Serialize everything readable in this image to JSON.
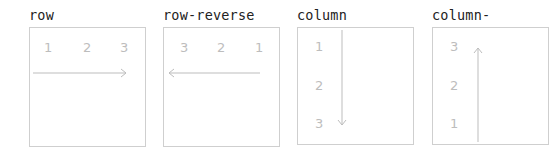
{
  "diagrams": [
    {
      "label": "row",
      "items": [
        "1",
        "2",
        "3"
      ],
      "direction": "right"
    },
    {
      "label": "row-reverse",
      "items": [
        "3",
        "2",
        "1"
      ],
      "direction": "left"
    },
    {
      "label": "column",
      "items": [
        "1",
        "2",
        "3"
      ],
      "direction": "down"
    },
    {
      "label": "column-reverse",
      "items": [
        "3",
        "2",
        "1"
      ],
      "direction": "up"
    }
  ],
  "colors": {
    "border": "#cfcfcf",
    "number": "#bdbdbd",
    "arrow": "#bdbdbd",
    "label": "#222222"
  }
}
